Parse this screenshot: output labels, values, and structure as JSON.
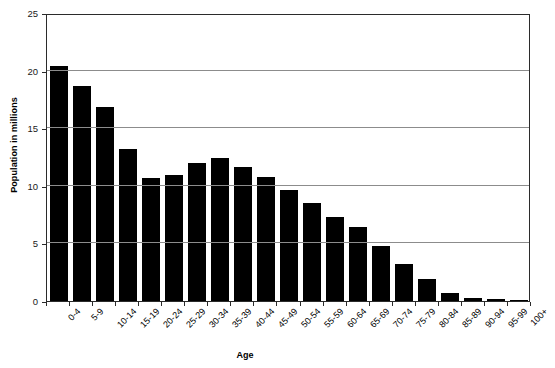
{
  "chart_data": {
    "type": "bar",
    "title": "",
    "xlabel": "Age",
    "ylabel": "Population in millions",
    "categories": [
      "0-4",
      "5-9",
      "10-14",
      "15-19",
      "20-24",
      "25-29",
      "30-34",
      "35-39",
      "40-44",
      "45-49",
      "50-54",
      "55-59",
      "60-64",
      "65-69",
      "70-74",
      "75-79",
      "80-84",
      "85-89",
      "90-94",
      "95-99",
      "100+"
    ],
    "values": [
      20.4,
      18.7,
      16.8,
      13.2,
      10.7,
      10.9,
      12.0,
      12.4,
      11.6,
      10.8,
      9.6,
      8.5,
      7.3,
      6.4,
      4.8,
      3.2,
      1.9,
      0.7,
      0.3,
      0.15,
      0.05
    ],
    "ylim": [
      0,
      25
    ],
    "yticks": [
      0,
      5,
      10,
      15,
      20,
      25
    ],
    "ytick_labels": [
      "0",
      "5",
      "10",
      "15",
      "20",
      "25"
    ],
    "grid": true,
    "legend": "none",
    "bar_color": "#000000",
    "gridline_color": "#8c8c8c",
    "axis_color": "#2b2b2b",
    "background_color": "#ffffff"
  }
}
